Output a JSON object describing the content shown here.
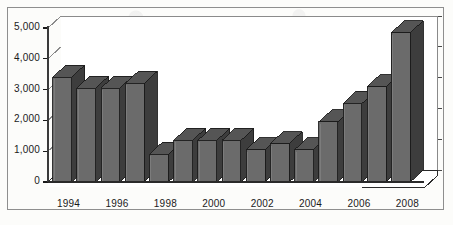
{
  "figure": {
    "background_color": "#fcfcfa",
    "frame_color": "#8e8e8e"
  },
  "chart_data": {
    "type": "bar",
    "title": "",
    "subtitle": "",
    "xlabel": "",
    "ylabel": "",
    "categories": [
      "1994",
      "1995",
      "1996",
      "1997",
      "1998",
      "1999",
      "2000",
      "2001",
      "2002",
      "2003",
      "2004",
      "2005",
      "2006",
      "2007",
      "2008"
    ],
    "values": [
      3400,
      3050,
      3050,
      3200,
      900,
      1350,
      1350,
      1350,
      1050,
      1250,
      1050,
      1950,
      2550,
      3100,
      4850
    ],
    "series": [
      {
        "name": "",
        "values": [
          3400,
          3050,
          3050,
          3200,
          900,
          1350,
          1350,
          1350,
          1050,
          1250,
          1050,
          1950,
          2550,
          3100,
          4850
        ]
      }
    ],
    "ylim": [
      0,
      5000
    ],
    "yticks": [
      0,
      1000,
      2000,
      3000,
      4000,
      5000
    ],
    "ytick_labels": [
      "0",
      "1,000",
      "2,000",
      "3,000",
      "4,000",
      "5,000"
    ],
    "xtick_labels": [
      "1994",
      "1996",
      "1998",
      "2000",
      "2002",
      "2004",
      "2006",
      "2008"
    ],
    "xtick_categories": [
      "1994",
      "1996",
      "1998",
      "2000",
      "2002",
      "2004",
      "2006",
      "2008"
    ],
    "grid": true,
    "grid_axis": "y",
    "grid_color": "#8a8a8a",
    "legend": false,
    "legend_position": "none",
    "style": "3d-column",
    "bar_face_color": "#6b6b6b",
    "bar_side_color": "#3d3d3d",
    "bar_top_color": "#555555",
    "bar_edge_color": "#1c1c1c",
    "annotations": []
  }
}
